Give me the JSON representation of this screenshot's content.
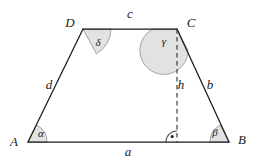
{
  "figure": {
    "shape_type": "trapezoid",
    "colors": {
      "stroke": "#1a1a1a",
      "angle_fill": "#e2e2e2",
      "angle_stroke": "#9a9a9a",
      "background": "#ffffff",
      "dashed": "#3a3a3a"
    },
    "vertices": [
      {
        "id": "A",
        "label": "A",
        "x": 28,
        "y": 142,
        "label_x": 14,
        "label_y": 143
      },
      {
        "id": "B",
        "label": "B",
        "x": 229,
        "y": 142,
        "label_x": 242,
        "label_y": 141
      },
      {
        "id": "C",
        "label": "C",
        "x": 177,
        "y": 29,
        "label_x": 191,
        "label_y": 24
      },
      {
        "id": "D",
        "label": "D",
        "x": 83,
        "y": 29,
        "label_x": 70,
        "label_y": 24
      }
    ],
    "sides": [
      {
        "id": "a",
        "label": "a",
        "from": "A",
        "to": "B",
        "label_x": 128,
        "label_y": 153
      },
      {
        "id": "b",
        "label": "b",
        "from": "B",
        "to": "C",
        "label_x": 210,
        "label_y": 86
      },
      {
        "id": "c",
        "label": "c",
        "from": "C",
        "to": "D",
        "label_x": 130,
        "label_y": 15
      },
      {
        "id": "d",
        "label": "d",
        "from": "D",
        "to": "A",
        "label_x": 49,
        "label_y": 86
      }
    ],
    "height": {
      "id": "h",
      "label": "h",
      "from_x": 177,
      "from_y": 29,
      "to_x": 177,
      "to_y": 142,
      "label_x": 180,
      "label_y": 86,
      "style": "dashed"
    },
    "angles": [
      {
        "id": "alpha",
        "label": "α",
        "vertex": "A",
        "label_x": 41,
        "label_y": 133,
        "radius": 19
      },
      {
        "id": "beta",
        "label": "β",
        "vertex": "B",
        "label_x": 215,
        "label_y": 132,
        "radius": 19
      },
      {
        "id": "gamma",
        "label": "γ",
        "vertex": "C",
        "label_x": 164,
        "label_y": 41,
        "radius": 24
      },
      {
        "id": "delta",
        "label": "δ",
        "vertex": "D",
        "label_x": 98,
        "label_y": 42,
        "radius": 28
      }
    ],
    "right_angle": {
      "id": "right-angle-marker",
      "label": "",
      "x": 177,
      "y": 142,
      "radius": 11,
      "dot_x": 172,
      "dot_y": 136
    }
  }
}
